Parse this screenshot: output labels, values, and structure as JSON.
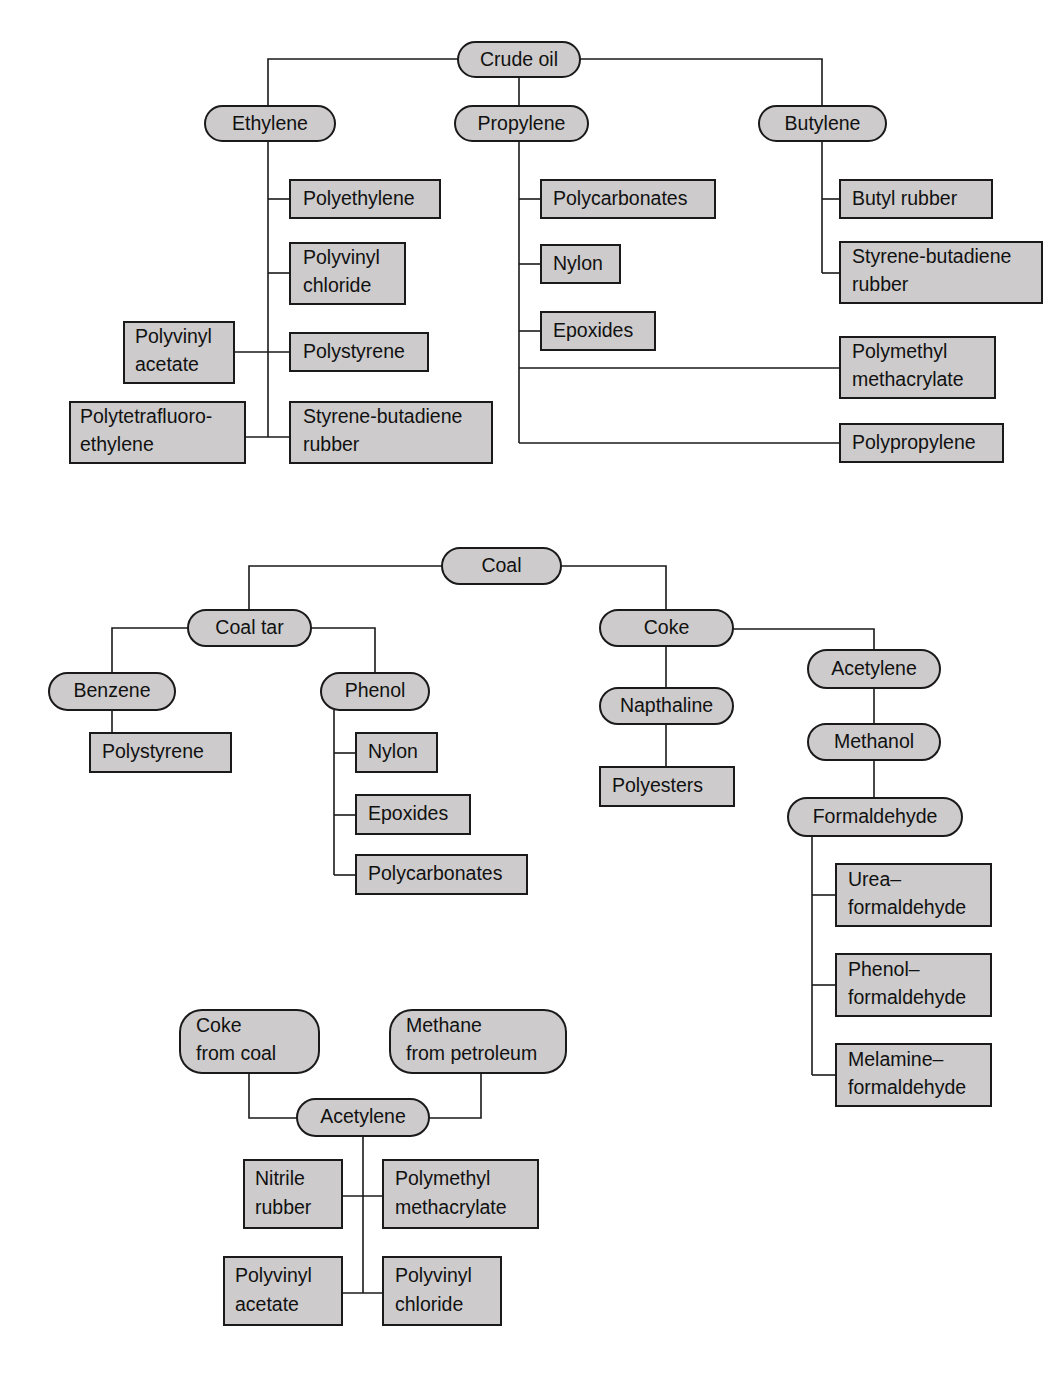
{
  "diagram": {
    "style": {
      "node_fill": "#cdcbcb",
      "node_stroke": "#1a1a1a",
      "connector_color": "#1a1a1a",
      "background": "#ffffff"
    },
    "charts": [
      {
        "id": "crude-oil-chart",
        "root": "Crude oil",
        "nodes": [
          {
            "key": "crude_oil",
            "label": "Crude oil",
            "shape": "pill"
          },
          {
            "key": "ethylene",
            "label": "Ethylene",
            "shape": "pill"
          },
          {
            "key": "propylene",
            "label": "Propylene",
            "shape": "pill"
          },
          {
            "key": "butylene",
            "label": "Butylene",
            "shape": "pill"
          },
          {
            "key": "polyethylene",
            "label": "Polyethylene",
            "shape": "box"
          },
          {
            "key": "polyvinyl_chloride",
            "label": "Polyvinyl\nchloride",
            "shape": "box"
          },
          {
            "key": "polystyrene",
            "label": "Polystyrene",
            "shape": "box"
          },
          {
            "key": "styrene_butadiene_rubber_e",
            "label": "Styrene-butadiene\nrubber",
            "shape": "box"
          },
          {
            "key": "polyvinyl_acetate",
            "label": "Polyvinyl\nacetate",
            "shape": "box"
          },
          {
            "key": "polytetrafluoroethylene",
            "label": "Polytetrafluoro-\nethylene",
            "shape": "box"
          },
          {
            "key": "polycarbonates_p",
            "label": "Polycarbonates",
            "shape": "box"
          },
          {
            "key": "nylon_p",
            "label": "Nylon",
            "shape": "box"
          },
          {
            "key": "epoxides_p",
            "label": "Epoxides",
            "shape": "box"
          },
          {
            "key": "polymethyl_methacrylate_p",
            "label": "Polymethyl\nmethacrylate",
            "shape": "box"
          },
          {
            "key": "polypropylene",
            "label": "Polypropylene",
            "shape": "box"
          },
          {
            "key": "butyl_rubber",
            "label": "Butyl rubber",
            "shape": "box"
          },
          {
            "key": "styrene_butadiene_rubber_b",
            "label": "Styrene-butadiene\nrubber",
            "shape": "box"
          }
        ],
        "edges": [
          [
            "crude_oil",
            "ethylene"
          ],
          [
            "crude_oil",
            "propylene"
          ],
          [
            "crude_oil",
            "butylene"
          ],
          [
            "ethylene",
            "polyethylene"
          ],
          [
            "ethylene",
            "polyvinyl_chloride"
          ],
          [
            "ethylene",
            "polystyrene"
          ],
          [
            "ethylene",
            "styrene_butadiene_rubber_e"
          ],
          [
            "polyvinyl_acetate",
            "polystyrene"
          ],
          [
            "polytetrafluoroethylene",
            "styrene_butadiene_rubber_e"
          ],
          [
            "propylene",
            "polycarbonates_p"
          ],
          [
            "propylene",
            "nylon_p"
          ],
          [
            "propylene",
            "epoxides_p"
          ],
          [
            "propylene",
            "polymethyl_methacrylate_p"
          ],
          [
            "propylene",
            "polypropylene"
          ],
          [
            "butylene",
            "butyl_rubber"
          ],
          [
            "butylene",
            "styrene_butadiene_rubber_b"
          ]
        ]
      },
      {
        "id": "coal-chart",
        "root": "Coal",
        "nodes": [
          {
            "key": "coal",
            "label": "Coal",
            "shape": "pill"
          },
          {
            "key": "coal_tar",
            "label": "Coal tar",
            "shape": "pill"
          },
          {
            "key": "coke",
            "label": "Coke",
            "shape": "pill"
          },
          {
            "key": "benzene",
            "label": "Benzene",
            "shape": "pill"
          },
          {
            "key": "phenol",
            "label": "Phenol",
            "shape": "pill"
          },
          {
            "key": "polystyrene_b",
            "label": "Polystyrene",
            "shape": "box"
          },
          {
            "key": "nylon_ph",
            "label": "Nylon",
            "shape": "box"
          },
          {
            "key": "epoxides_ph",
            "label": "Epoxides",
            "shape": "box"
          },
          {
            "key": "polycarbonates_ph",
            "label": "Polycarbonates",
            "shape": "box"
          },
          {
            "key": "napthaline",
            "label": "Napthaline",
            "shape": "pill"
          },
          {
            "key": "polyesters",
            "label": "Polyesters",
            "shape": "box"
          },
          {
            "key": "acetylene_c",
            "label": "Acetylene",
            "shape": "pill"
          },
          {
            "key": "methanol",
            "label": "Methanol",
            "shape": "pill"
          },
          {
            "key": "formaldehyde",
            "label": "Formaldehyde",
            "shape": "pill"
          },
          {
            "key": "urea_formaldehyde",
            "label": "Urea–\nformaldehyde",
            "shape": "box"
          },
          {
            "key": "phenol_formaldehyde",
            "label": "Phenol–\nformaldehyde",
            "shape": "box"
          },
          {
            "key": "melamine_formaldehyde",
            "label": "Melamine–\nformaldehyde",
            "shape": "box"
          }
        ],
        "edges": [
          [
            "coal",
            "coal_tar"
          ],
          [
            "coal",
            "coke"
          ],
          [
            "coal_tar",
            "benzene"
          ],
          [
            "coal_tar",
            "phenol"
          ],
          [
            "benzene",
            "polystyrene_b"
          ],
          [
            "phenol",
            "nylon_ph"
          ],
          [
            "phenol",
            "epoxides_ph"
          ],
          [
            "phenol",
            "polycarbonates_ph"
          ],
          [
            "coke",
            "napthaline"
          ],
          [
            "napthaline",
            "polyesters"
          ],
          [
            "coke",
            "acetylene_c"
          ],
          [
            "acetylene_c",
            "methanol"
          ],
          [
            "methanol",
            "formaldehyde"
          ],
          [
            "formaldehyde",
            "urea_formaldehyde"
          ],
          [
            "formaldehyde",
            "phenol_formaldehyde"
          ],
          [
            "formaldehyde",
            "melamine_formaldehyde"
          ]
        ]
      },
      {
        "id": "acetylene-chart",
        "root": "Acetylene",
        "nodes": [
          {
            "key": "coke_from_coal",
            "label": "Coke\nfrom coal",
            "shape": "pill"
          },
          {
            "key": "methane_from_petroleum",
            "label": "Methane\nfrom petroleum",
            "shape": "pill"
          },
          {
            "key": "acetylene",
            "label": "Acetylene",
            "shape": "pill"
          },
          {
            "key": "nitrile_rubber",
            "label": "Nitrile\nrubber",
            "shape": "box"
          },
          {
            "key": "polymethyl_methacrylate_a",
            "label": "Polymethyl\nmethacrylate",
            "shape": "box"
          },
          {
            "key": "polyvinyl_acetate_a",
            "label": "Polyvinyl\nacetate",
            "shape": "box"
          },
          {
            "key": "polyvinyl_chloride_a",
            "label": "Polyvinyl\nchloride",
            "shape": "box"
          }
        ],
        "edges": [
          [
            "coke_from_coal",
            "acetylene"
          ],
          [
            "methane_from_petroleum",
            "acetylene"
          ],
          [
            "acetylene",
            "nitrile_rubber"
          ],
          [
            "acetylene",
            "polymethyl_methacrylate_a"
          ],
          [
            "acetylene",
            "polyvinyl_acetate_a"
          ],
          [
            "acetylene",
            "polyvinyl_chloride_a"
          ]
        ]
      }
    ],
    "labels": {
      "crude_oil": "Crude oil",
      "ethylene": "Ethylene",
      "propylene": "Propylene",
      "butylene": "Butylene",
      "polyethylene": "Polyethylene",
      "polyvinyl_1": "Polyvinyl",
      "chloride_1": "chloride",
      "polystyrene_1": "Polystyrene",
      "styrene_butadiene_1": "Styrene-butadiene",
      "rubber_1": "rubber",
      "polyvinyl_2": "Polyvinyl",
      "acetate_1": "acetate",
      "polytetrafluoro": "Polytetrafluoro-",
      "ethylene_2": "ethylene",
      "polycarbonates_1": "Polycarbonates",
      "nylon_1": "Nylon",
      "epoxides_1": "Epoxides",
      "polymethyl_1": "Polymethyl",
      "methacrylate_1": "methacrylate",
      "polypropylene": "Polypropylene",
      "butyl_rubber": "Butyl rubber",
      "styrene_butadiene_2": "Styrene-butadiene",
      "rubber_2": "rubber",
      "coal": "Coal",
      "coal_tar": "Coal tar",
      "coke": "Coke",
      "benzene": "Benzene",
      "phenol": "Phenol",
      "polystyrene_2": "Polystyrene",
      "nylon_2": "Nylon",
      "epoxides_2": "Epoxides",
      "polycarbonates_2": "Polycarbonates",
      "napthaline": "Napthaline",
      "polyesters": "Polyesters",
      "acetylene_1": "Acetylene",
      "methanol": "Methanol",
      "formaldehyde": "Formaldehyde",
      "urea_dash": "Urea–",
      "formaldehyde_1": "formaldehyde",
      "phenol_dash": "Phenol–",
      "formaldehyde_2": "formaldehyde",
      "melamine_dash": "Melamine–",
      "formaldehyde_3": "formaldehyde",
      "coke_line1": "Coke",
      "coke_line2": "from coal",
      "methane_line1": "Methane",
      "methane_line2": "from petroleum",
      "acetylene_2": "Acetylene",
      "nitrile_line1": "Nitrile",
      "nitrile_line2": "rubber",
      "polymethyl_2": "Polymethyl",
      "methacrylate_2": "methacrylate",
      "polyvinyl_3": "Polyvinyl",
      "acetate_2": "acetate",
      "polyvinyl_4": "Polyvinyl",
      "chloride_2": "chloride"
    }
  }
}
